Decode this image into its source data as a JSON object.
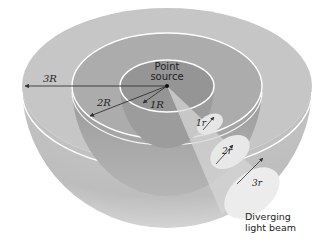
{
  "diagram": {
    "labels": {
      "source_line1": "Point",
      "source_line2": "source",
      "radius_outer": "3R",
      "radius_middle": "2R",
      "radius_inner": "1R",
      "beam_1": "1r",
      "beam_2": "2r",
      "beam_3": "3r",
      "beam_caption_line1": "Diverging",
      "beam_caption_line2": "light beam"
    },
    "shells": [
      {
        "name": "inner",
        "radius_label": "1R",
        "beam_spot_label": "1r"
      },
      {
        "name": "middle",
        "radius_label": "2R",
        "beam_spot_label": "2r"
      },
      {
        "name": "outer",
        "radius_label": "3R",
        "beam_spot_label": "3r"
      }
    ],
    "colors": {
      "outer_shell": "#c4c4c4",
      "middle_shell": "#a9a9a9",
      "inner_shell": "#8f8f8f",
      "hemisphere_body": "#bdbdbd",
      "beam": "#e8e8e8",
      "rim_line": "#ffffff",
      "arrow": "#333333"
    }
  }
}
